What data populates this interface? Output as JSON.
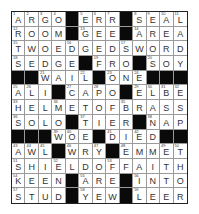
{
  "puzzle": {
    "rows": 13,
    "cols": 13,
    "grid": [
      "ARGO#ERR#SEAL",
      "ROOM#GEE#AREA",
      "TWOEDGEDSWORD",
      "SEDGE#FRO#SOY",
      "##WAIL#ONE###",
      "ALI#CAPO#ELBE",
      "HELMETOFBRASS",
      "SOLO#TIER#NAP",
      "###WOE#DIED##",
      "AWL#WRY#EMMET",
      "SHIELDOFFAITH",
      "KEEN#ARE#INTO",
      "STUD#YEW#LEER"
    ],
    "numbers": [
      [
        1,
        2,
        3,
        4,
        0,
        5,
        6,
        7,
        0,
        8,
        9,
        10,
        11
      ],
      [
        12,
        0,
        0,
        0,
        0,
        13,
        0,
        0,
        0,
        14,
        0,
        0,
        0
      ],
      [
        15,
        0,
        0,
        0,
        16,
        0,
        0,
        0,
        17,
        0,
        0,
        0,
        0
      ],
      [
        18,
        0,
        0,
        0,
        0,
        0,
        19,
        0,
        0,
        0,
        20,
        0,
        0
      ],
      [
        0,
        0,
        21,
        0,
        0,
        22,
        0,
        23,
        0,
        24,
        0,
        0,
        0
      ],
      [
        25,
        26,
        0,
        0,
        27,
        0,
        28,
        0,
        0,
        29,
        30,
        31,
        32
      ],
      [
        33,
        0,
        0,
        34,
        0,
        0,
        0,
        0,
        35,
        0,
        0,
        0,
        0
      ],
      [
        36,
        0,
        0,
        0,
        0,
        37,
        0,
        0,
        0,
        0,
        38,
        0,
        0
      ],
      [
        0,
        0,
        0,
        39,
        40,
        0,
        0,
        41,
        0,
        42,
        0,
        0,
        0
      ],
      [
        43,
        44,
        45,
        0,
        46,
        0,
        47,
        0,
        48,
        0,
        0,
        49,
        50
      ],
      [
        51,
        0,
        0,
        52,
        0,
        0,
        0,
        53,
        0,
        0,
        0,
        0,
        0
      ],
      [
        54,
        0,
        0,
        0,
        0,
        55,
        0,
        0,
        0,
        56,
        0,
        0,
        0
      ],
      [
        57,
        0,
        0,
        0,
        0,
        58,
        0,
        0,
        0,
        59,
        0,
        0,
        0
      ]
    ],
    "colors": {
      "block": "#0a0a0a",
      "cell": "#ffffff",
      "letter": "#333333",
      "gridline": "#9a9a9a"
    }
  }
}
